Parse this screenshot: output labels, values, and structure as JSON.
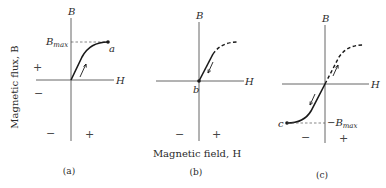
{
  "figure": {
    "y_axis_title": "Magnetic flux, B",
    "x_axis_title": "Magnetic field, H",
    "panels": [
      {
        "id": "a",
        "caption": "(a)",
        "axis_b": "B",
        "axis_h": "H",
        "bmax_label": "B",
        "bmax_sub": "max",
        "point_label": "a",
        "sign_upper_left": "+",
        "sign_lower_left": "−",
        "sign_bottom_left": "−",
        "sign_bottom_right": "+"
      },
      {
        "id": "b",
        "caption": "(b)",
        "axis_b": "B",
        "axis_h": "H",
        "point_label": "b",
        "sign_bottom_left": "−",
        "sign_bottom_right": "+"
      },
      {
        "id": "c",
        "caption": "(c)",
        "axis_b": "B",
        "axis_h": "H",
        "bmax_label": "−B",
        "bmax_sub": "max",
        "point_label": "c",
        "sign_bottom_left": "−",
        "sign_bottom_right": "+"
      }
    ]
  }
}
